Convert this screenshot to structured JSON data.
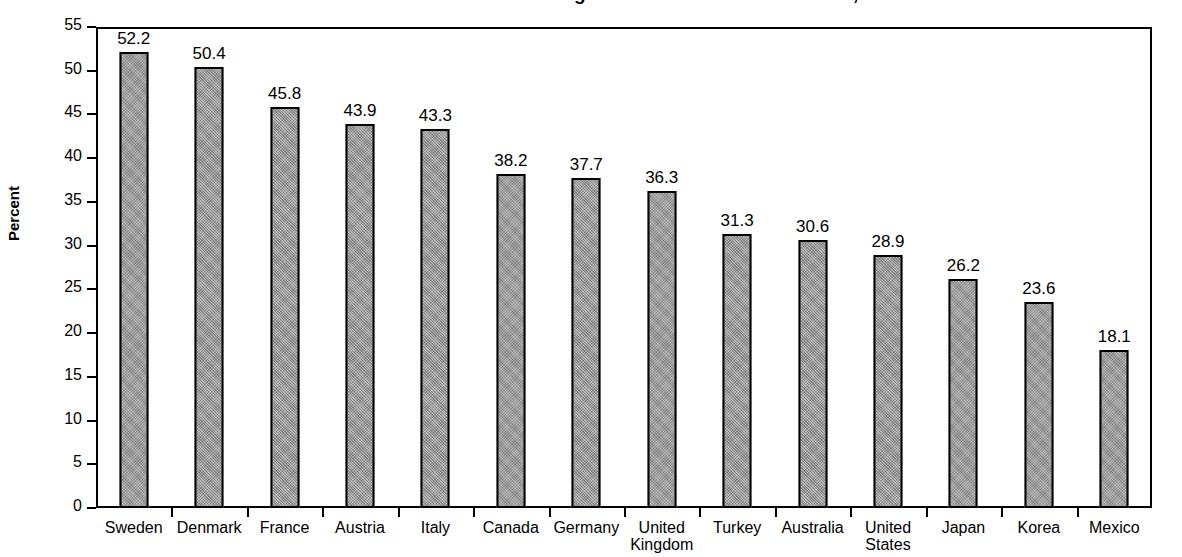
{
  "chart_data": {
    "type": "bar",
    "title": "Total Tax Revenue as a Percentage of Gross Domestic Product, 1999",
    "title_note": "title is cropped at top edge of screenshot",
    "xlabel": "",
    "ylabel": "Percent",
    "ylim": [
      0,
      55
    ],
    "ytick_step": 5,
    "grid": false,
    "legend": false,
    "bar_color": "#9a9a9a",
    "bar_edge_color": "#000000",
    "categories": [
      "Sweden",
      "Denmark",
      "France",
      "Austria",
      "Italy",
      "Canada",
      "Germany",
      "United\nKingdom",
      "Turkey",
      "Australia",
      "United\nStates",
      "Japan",
      "Korea",
      "Mexico"
    ],
    "values": [
      52.2,
      50.4,
      45.8,
      43.9,
      43.3,
      38.2,
      37.7,
      36.3,
      31.3,
      30.6,
      28.9,
      26.2,
      23.6,
      18.1
    ],
    "value_labels": [
      "52.2",
      "50.4",
      "45.8",
      "43.9",
      "43.3",
      "38.2",
      "37.7",
      "36.3",
      "31.3",
      "30.6",
      "28.9",
      "26.2",
      "23.6",
      "18.1"
    ],
    "ytick_labels": [
      "55",
      "50",
      "45",
      "40",
      "35",
      "30",
      "25",
      "20",
      "15",
      "10",
      "5",
      "0"
    ],
    "ytick_values": [
      55,
      50,
      45,
      40,
      35,
      30,
      25,
      20,
      15,
      10,
      5,
      0
    ]
  }
}
